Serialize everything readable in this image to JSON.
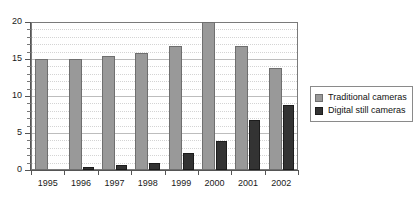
{
  "chart_data": {
    "type": "bar",
    "title": "",
    "xlabel": "",
    "ylabel": "",
    "categories": [
      "1995",
      "1996",
      "1997",
      "1998",
      "1999",
      "2000",
      "2001",
      "2002"
    ],
    "series": [
      {
        "name": "Traditional cameras",
        "color": "#999999",
        "values": [
          15.0,
          15.0,
          15.4,
          15.8,
          16.8,
          20.0,
          16.8,
          13.8
        ]
      },
      {
        "name": "Digital still cameras",
        "color": "#333333",
        "values": [
          0.0,
          0.4,
          0.7,
          0.9,
          2.3,
          3.9,
          6.7,
          8.8
        ]
      }
    ],
    "ylim": [
      0,
      20
    ],
    "yticks": [
      0,
      5,
      10,
      15,
      20
    ],
    "ytick_labels": [
      "0",
      "5",
      "10",
      "15",
      "20"
    ],
    "yminor_ticks": [
      1,
      2,
      3,
      4,
      6,
      7,
      8,
      9,
      11,
      12,
      13,
      14,
      16,
      17,
      18,
      19
    ],
    "grid": true,
    "legend_position": "right"
  },
  "legend": {
    "entries": [
      {
        "label": "Traditional cameras",
        "swatch": "legend-swatch-traditional"
      },
      {
        "label": "Digital still cameras",
        "swatch": "legend-swatch-digital"
      }
    ]
  },
  "axes": {
    "y_tick_labels": [
      "0",
      "5",
      "10",
      "15",
      "20"
    ],
    "x_tick_labels": [
      "1995",
      "1996",
      "1997",
      "1998",
      "1999",
      "2000",
      "2001",
      "2002"
    ]
  }
}
